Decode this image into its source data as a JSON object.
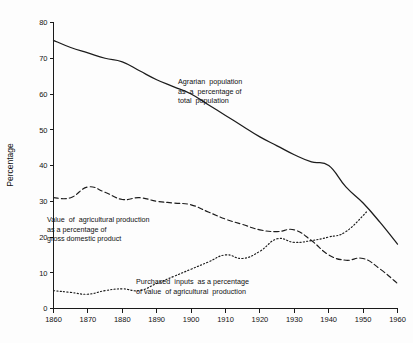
{
  "chart_data": {
    "type": "line",
    "title": "",
    "xlabel": "",
    "ylabel": "Percentage",
    "xlim": [
      1860,
      1960
    ],
    "ylim": [
      0,
      80
    ],
    "xticks": [
      1860,
      1870,
      1880,
      1890,
      1900,
      1910,
      1920,
      1930,
      1940,
      1950,
      1960
    ],
    "yticks": [
      0,
      10,
      20,
      30,
      40,
      50,
      60,
      70,
      80
    ],
    "grid": false,
    "legend": "inline-annotations",
    "series": [
      {
        "name": "Agrarian population as a percentage of total population",
        "style": "solid",
        "x": [
          1860,
          1865,
          1870,
          1875,
          1880,
          1885,
          1890,
          1895,
          1900,
          1905,
          1910,
          1915,
          1920,
          1925,
          1930,
          1935,
          1940,
          1945,
          1950,
          1955,
          1960
        ],
        "values": [
          75,
          73,
          71.5,
          70,
          69,
          66.5,
          64,
          62,
          60,
          57,
          54,
          51,
          48,
          45.5,
          43,
          41,
          40,
          34,
          29.5,
          24,
          18
        ]
      },
      {
        "name": "Value of agricultural production as a percentage of gross domestic product",
        "style": "dashed",
        "x": [
          1860,
          1865,
          1870,
          1875,
          1880,
          1885,
          1890,
          1895,
          1900,
          1905,
          1910,
          1915,
          1920,
          1925,
          1930,
          1935,
          1940,
          1945,
          1950,
          1955,
          1960
        ],
        "values": [
          31,
          31,
          34,
          32.5,
          30.5,
          31,
          30,
          29.5,
          29,
          27,
          25,
          23.5,
          22,
          21.5,
          22,
          19,
          15,
          13.5,
          14,
          11,
          7
        ]
      },
      {
        "name": "Purchased inputs as a percentage of value of agricultural production",
        "style": "dotted",
        "x": [
          1860,
          1865,
          1870,
          1875,
          1880,
          1885,
          1890,
          1895,
          1900,
          1905,
          1910,
          1915,
          1920,
          1925,
          1930,
          1935,
          1940,
          1945,
          1951
        ],
        "values": [
          5,
          4.5,
          4,
          5,
          5.5,
          5,
          7,
          9,
          11,
          13,
          15,
          14,
          16,
          19.5,
          18.5,
          19,
          20,
          21.5,
          27
        ]
      }
    ],
    "annotations": [
      {
        "id": "annot-agrarian",
        "lines": [
          "Agrarian  population",
          "as  a  percentage of",
          "total  population"
        ],
        "x": 178,
        "y": 84
      },
      {
        "id": "annot-agprod",
        "lines": [
          "Value  of  agricultural production",
          "as a percentage of",
          "gross domestic product"
        ],
        "x": 47,
        "y": 222
      },
      {
        "id": "annot-inputs",
        "lines": [
          "Purchased  inputs  as a percentage",
          "of value  of agricultural  production"
        ],
        "x": 136,
        "y": 284
      }
    ]
  }
}
